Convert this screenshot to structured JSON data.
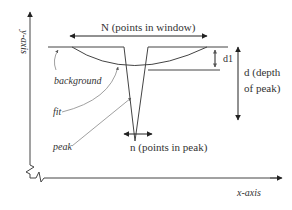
{
  "diagram": {
    "axes": {
      "y_label": "y-axis",
      "x_label": "x-axis"
    },
    "annotations": {
      "window_width": "N (points in window)",
      "peak_width": "n (points in peak)",
      "d1": "d1",
      "depth_line1": "d (depth",
      "depth_line2": "of peak)"
    },
    "callouts": {
      "background": "background",
      "fit": "fit",
      "peak": "peak"
    },
    "colors": {
      "line": "#333333",
      "leader": "#888888",
      "background": "#ffffff"
    }
  }
}
